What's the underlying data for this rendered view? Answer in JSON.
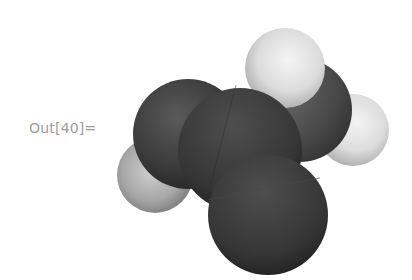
{
  "cell": {
    "label": "Out[40]=",
    "output_type": "Graphics3D"
  },
  "molecule": {
    "model": "space-filling",
    "atoms": [
      {
        "name": "hydrogen-top",
        "kind": "light"
      },
      {
        "name": "hydrogen-right",
        "kind": "light"
      },
      {
        "name": "hydrogen-left",
        "kind": "light"
      },
      {
        "name": "heavy-atom-upper-left",
        "kind": "dark"
      },
      {
        "name": "heavy-atom-center",
        "kind": "dark"
      },
      {
        "name": "heavy-atom-bottom",
        "kind": "dark"
      },
      {
        "name": "heavy-atom-right",
        "kind": "dark"
      }
    ]
  },
  "colors": {
    "label_text": "#9c9c9c",
    "dark_atom": "#3a3a3a",
    "light_atom": "#e6e6e6",
    "background": "#ffffff"
  }
}
